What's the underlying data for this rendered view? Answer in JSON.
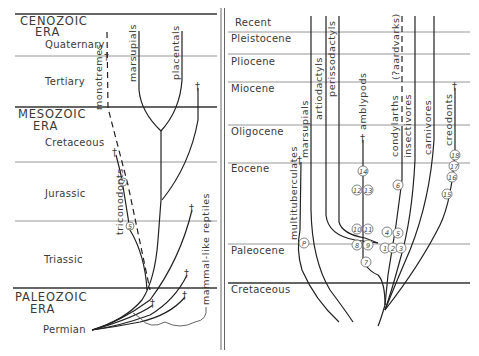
{
  "left_panel": {
    "eras": [
      {
        "name": "CENOZOIC",
        "suffix": "ERA"
      },
      {
        "name": "MESOZOIC",
        "suffix": "ERA"
      },
      {
        "name": "PALEOZOIC",
        "suffix": "ERA"
      }
    ],
    "periods": [
      "Quaternary",
      "Tertiary",
      "Cretaceous",
      "Jurassic",
      "Triassic",
      "Permian"
    ],
    "lineages": {
      "monotremes": "monotremes",
      "marsupials": "marsupials",
      "placentals": "placentals",
      "triconodonts": "triconodonts",
      "mammal_like_reptiles": "mammal-like reptiles"
    },
    "markers": {
      "m7": "7",
      "m5": "5"
    }
  },
  "right_panel": {
    "epochs": [
      "Recent",
      "Pleistocene",
      "Pliocene",
      "Miocene",
      "Oligocene",
      "Eocene",
      "Paleocene",
      "Cretaceous"
    ],
    "lineages": {
      "multituberculates": "multituberculates",
      "marsupials": "marsupials",
      "artiodactyls": "artiodactyls",
      "perissodactyls": "perissodactyls",
      "amblypods": "amblypods",
      "condylarths": "condylarths",
      "aardvarks": "(?aardvarks)",
      "insectivores": "insectivores",
      "carnivores": "carnivores",
      "creodonts": "creodonts"
    },
    "markers": {
      "P": "P",
      "m1": "1",
      "m2": "2",
      "m3": "3",
      "m4": "4",
      "m5": "5",
      "m6": "6",
      "m7": "7",
      "m8": "8",
      "m9": "9",
      "m10": "10",
      "m11": "11",
      "m12": "12",
      "m13": "13",
      "m14": "14",
      "m15": "15",
      "m16": "16",
      "m17": "17",
      "m18": "18"
    }
  },
  "extinction_symbol": "†"
}
